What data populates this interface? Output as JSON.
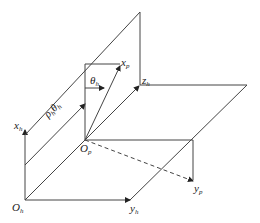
{
  "diagram": {
    "type": "coordinate-frame-diagram",
    "colors": {
      "line": "#333333",
      "background": "#ffffff"
    },
    "labels": {
      "origin_h": {
        "base": "O",
        "sub": "h"
      },
      "origin_p": {
        "base": "O",
        "sub": "p"
      },
      "x_h": {
        "base": "x",
        "sub": "h"
      },
      "y_h": {
        "base": "y",
        "sub": "h"
      },
      "z_h": {
        "base": "z",
        "sub": "h"
      },
      "x_p": {
        "base": "x",
        "sub": "p"
      },
      "y_p": {
        "base": "y",
        "sub": "p"
      },
      "theta_h": {
        "base": "θ",
        "sub": "h"
      },
      "rho_theta": {
        "base1": "ρ",
        "sub1": "h",
        "base2": "θ",
        "sub2": "h"
      }
    }
  }
}
